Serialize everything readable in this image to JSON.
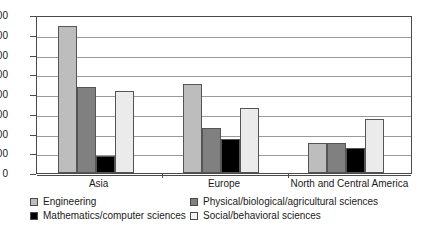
{
  "chart_data": {
    "type": "bar",
    "title": "",
    "subtitle": "",
    "xlabel": "",
    "ylabel": "",
    "ylim": [
      0,
      800
    ],
    "ytick_step": 100,
    "yticks": [
      "0",
      "100",
      "200",
      "300",
      "400",
      "500",
      "600",
      "700",
      "800"
    ],
    "grid": true,
    "legend_position": "bottom",
    "categories": [
      "Asia",
      "Europe",
      "North and Central America"
    ],
    "series": [
      {
        "name": "Engineering",
        "color": "#bdbdbd",
        "values": [
          745,
          450,
          150
        ]
      },
      {
        "name": "Physical/biological/agricultural sciences",
        "color": "#808080",
        "values": [
          435,
          230,
          150
        ]
      },
      {
        "name": "Mathematics/computer sciences",
        "color": "#000000",
        "values": [
          85,
          170,
          125
        ]
      },
      {
        "name": "Social/behavioral sciences",
        "color": "#ebebeb",
        "values": [
          415,
          330,
          275
        ]
      }
    ]
  },
  "legend": {
    "items": [
      {
        "label": "Engineering",
        "swatch": "s0"
      },
      {
        "label": "Physical/biological/agricultural sciences",
        "swatch": "s1"
      },
      {
        "label": "Mathematics/computer sciences",
        "swatch": "s2"
      },
      {
        "label": "Social/behavioral sciences",
        "swatch": "s3"
      }
    ]
  },
  "axis": {
    "y_max_label": "800",
    "y_min_label": "0"
  }
}
